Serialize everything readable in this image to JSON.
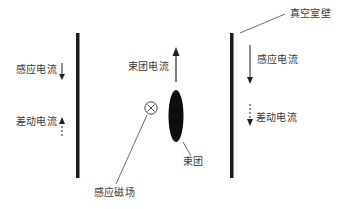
{
  "diagram": {
    "type": "physics-schematic",
    "labels": {
      "chamber_wall": "真空室壁",
      "left_induced_current": "感应电流",
      "left_differential_current": "差动电流",
      "right_induced_current": "感应电流",
      "right_differential_current": "差动电流",
      "beam_current": "束团电流",
      "beam_bunch": "束团",
      "induced_field": "感应磁场"
    },
    "arrows": {
      "left_induced_current_direction": "down",
      "left_differential_current_direction": "up",
      "right_induced_current_direction": "down",
      "right_differential_current_direction": "down",
      "beam_current_direction": "up"
    },
    "arrow_styles": {
      "induced_current": "solid",
      "differential_current": "dashed",
      "beam_current": "solid"
    },
    "symbols": {
      "magnetic_field": "circle-cross (into page)"
    },
    "colors": {
      "wall": "#1a1a1a",
      "beam": "#0d0d0d",
      "text": "#3a3a3a",
      "leader_line": "#444444"
    }
  }
}
